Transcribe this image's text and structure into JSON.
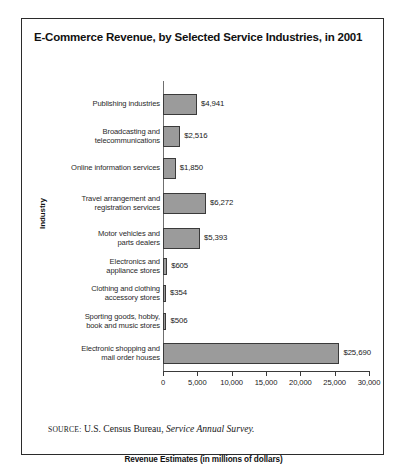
{
  "figure": {
    "title": "E-Commerce Revenue, by Selected Service Industries, in 2001",
    "source_label": "SOURCE:",
    "source_text": "U.S. Census Bureau,",
    "source_italic": "Service Annual Survey.",
    "frame_color": "#2b2b2b",
    "bar_fill": "#9b9b9b",
    "bar_border": "#3a3a3a"
  },
  "chart_data": {
    "type": "bar",
    "orientation": "horizontal",
    "title": "E-Commerce Revenue, by Selected Service Industries, in 2001",
    "xlabel": "Revenue Estimates (in millions of dollars)",
    "ylabel": "Industry",
    "xlim": [
      0,
      30000
    ],
    "xticks": [
      0,
      5000,
      10000,
      15000,
      20000,
      25000,
      30000
    ],
    "xtick_labels": [
      "0",
      "5,000",
      "10,000",
      "15,000",
      "20,000",
      "25,000",
      "30,000"
    ],
    "grid": false,
    "legend": null,
    "categories": [
      "Publishing industries",
      "Broadcasting and telecommunications",
      "Online information services",
      "Travel arrangement and registration services",
      "Motor vehicles and parts dealers",
      "Electronics and appliance stores",
      "Clothing and clothing accessory stores",
      "Sporting goods, hobby, book and music stores",
      "Electronic shopping and mail order houses"
    ],
    "category_lines": [
      [
        "Publishing industries"
      ],
      [
        "Broadcasting and",
        "telecommunications"
      ],
      [
        "Online information services"
      ],
      [
        "Travel arrangement and",
        "registration services"
      ],
      [
        "Motor vehicles and",
        "parts dealers"
      ],
      [
        "Electronics and",
        "appliance stores"
      ],
      [
        "Clothing and clothing",
        "accessory stores"
      ],
      [
        "Sporting goods, hobby,",
        "book and music stores"
      ],
      [
        "Electronic shopping and",
        "mail order houses"
      ]
    ],
    "values": [
      4941,
      2516,
      1850,
      6272,
      5393,
      605,
      354,
      506,
      25690
    ],
    "data_labels": [
      "$4,941",
      "$2,516",
      "$1,850",
      "$6,272",
      "$5,393",
      "$605",
      "$354",
      "$506",
      "$25,690"
    ]
  }
}
